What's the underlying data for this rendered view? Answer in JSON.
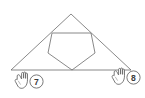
{
  "figure": {
    "background_color": "#ffffff",
    "stroke_color": "#6b6b6b",
    "stroke_width": 0.8,
    "triangle": {
      "name": "outer-triangle",
      "points": "71,14 11,70 131,70",
      "vertices": [
        {
          "label": "apex",
          "x": 71,
          "y": 14
        },
        {
          "label": "bottom-left",
          "x": 11,
          "y": 70
        },
        {
          "label": "bottom-right",
          "x": 131,
          "y": 70
        }
      ]
    },
    "pentagon": {
      "name": "inner-pentagon",
      "points": "52,33 91,33 95,53 72,70 48,53",
      "vertices": [
        {
          "label": "top-left",
          "x": 52,
          "y": 33
        },
        {
          "label": "top-right",
          "x": 91,
          "y": 33
        },
        {
          "label": "right",
          "x": 95,
          "y": 53
        },
        {
          "label": "bottom",
          "x": 72,
          "y": 70
        },
        {
          "label": "left",
          "x": 48,
          "y": 53
        }
      ]
    }
  },
  "markers": [
    {
      "id": "marker-7",
      "badge_label": "7",
      "icon": "pointing-hand-cursor-icon",
      "badge_text_color": "#3a3a3a",
      "badge_border_color": "#6b6b6b",
      "target_vertex": "bottom-left"
    },
    {
      "id": "marker-8",
      "badge_label": "8",
      "icon": "pointing-hand-cursor-icon",
      "badge_text_color": "#3a3a3a",
      "badge_border_color": "#6b6b6b",
      "target_vertex": "bottom-right"
    }
  ],
  "chart_data": {
    "type": "scatter",
    "xlabel": "",
    "ylabel": "",
    "series": [
      {
        "name": "outer-triangle",
        "x": [
          71,
          11,
          131,
          71
        ],
        "y": [
          14,
          70,
          70,
          14
        ]
      },
      {
        "name": "inner-pentagon",
        "x": [
          52,
          91,
          95,
          72,
          48,
          52
        ],
        "y": [
          33,
          33,
          53,
          70,
          53,
          33
        ]
      }
    ],
    "annotations": [
      {
        "text": "7",
        "x": 27,
        "y": 81
      },
      {
        "text": "8",
        "x": 130,
        "y": 76
      }
    ]
  }
}
